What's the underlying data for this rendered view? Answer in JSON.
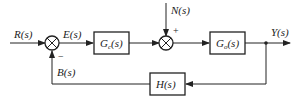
{
  "diagram": {
    "type": "control-block-diagram",
    "signals": {
      "input": "R(s)",
      "error": "E(s)",
      "disturbance": "N(s)",
      "output": "Y(s)",
      "feedback": "B(s)"
    },
    "blocks": {
      "controller": {
        "main": "G",
        "sub": "c",
        "arg": "(s)"
      },
      "plant": {
        "main": "G",
        "sub": "o",
        "arg": "(s)"
      },
      "feedback": {
        "label": "H(s)"
      }
    },
    "summing_junctions": {
      "sum1": {
        "feedback_sign": "−"
      },
      "sum2": {
        "disturbance_sign": "+"
      }
    },
    "colors": {
      "stroke": "#222222",
      "background": "#ffffff"
    }
  }
}
